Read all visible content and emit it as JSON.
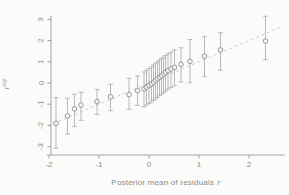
{
  "figure": {
    "xlabel_prefix": "Posterior mean of residuals",
    "xlabel_var": "r",
    "ylabel_var": "r",
    "ylabel_sup": "rep"
  },
  "colors": {
    "background": "#fbfbfa",
    "axis": "#9a9a9a",
    "tick_text": "#8c8c8c",
    "label_text": "#8a8a8a",
    "point_stroke": "#8f8f8f",
    "point_fill": "#f6f6f5",
    "errorbar": "#a8a8a8",
    "dashed_line": "#c6c6c6"
  },
  "chart_data": {
    "type": "scatter",
    "title": "",
    "xlabel": "Posterior mean of residuals r",
    "ylabel": "r^rep",
    "xlim": [
      -2.1,
      2.7
    ],
    "ylim": [
      -3.4,
      3.2
    ],
    "x_ticks": [
      -2,
      -1,
      0,
      1,
      2
    ],
    "y_ticks": [
      -3,
      -2,
      -1,
      0,
      1,
      2,
      3
    ],
    "grid": false,
    "legend": null,
    "reference_line": {
      "style": "dashed",
      "slope": 1,
      "intercept": 0,
      "x_start": -2.02,
      "x_end": 2.7
    },
    "errorbar_style": "vertical-with-caps",
    "points": [
      {
        "x": -1.86,
        "y": -1.9,
        "lo": -3.08,
        "hi": -0.69
      },
      {
        "x": -1.63,
        "y": -1.55,
        "lo": -2.41,
        "hi": -0.72
      },
      {
        "x": -1.49,
        "y": -1.22,
        "lo": -2.06,
        "hi": -0.53
      },
      {
        "x": -1.36,
        "y": -1.04,
        "lo": -1.76,
        "hi": -0.44
      },
      {
        "x": -1.04,
        "y": -0.88,
        "lo": -1.48,
        "hi": -0.3
      },
      {
        "x": -0.77,
        "y": -0.65,
        "lo": -1.31,
        "hi": -0.06
      },
      {
        "x": -0.4,
        "y": -0.55,
        "lo": -1.24,
        "hi": 0.22
      },
      {
        "x": -0.23,
        "y": -0.36,
        "lo": -1.05,
        "hi": 0.33
      },
      {
        "x": -0.1,
        "y": -0.28,
        "lo": -1.12,
        "hi": 0.52
      },
      {
        "x": -0.05,
        "y": -0.2,
        "lo": -1.04,
        "hi": 0.6
      },
      {
        "x": 0.0,
        "y": -0.12,
        "lo": -0.97,
        "hi": 0.68
      },
      {
        "x": 0.05,
        "y": -0.04,
        "lo": -0.9,
        "hi": 0.76
      },
      {
        "x": 0.09,
        "y": 0.04,
        "lo": -0.82,
        "hi": 0.85
      },
      {
        "x": 0.13,
        "y": 0.12,
        "lo": -0.75,
        "hi": 0.93
      },
      {
        "x": 0.17,
        "y": 0.2,
        "lo": -0.68,
        "hi": 1.0
      },
      {
        "x": 0.21,
        "y": 0.27,
        "lo": -0.6,
        "hi": 1.08
      },
      {
        "x": 0.25,
        "y": 0.34,
        "lo": -0.53,
        "hi": 1.15
      },
      {
        "x": 0.29,
        "y": 0.42,
        "lo": -0.46,
        "hi": 1.22
      },
      {
        "x": 0.33,
        "y": 0.5,
        "lo": -0.38,
        "hi": 1.3
      },
      {
        "x": 0.38,
        "y": 0.58,
        "lo": -0.3,
        "hi": 1.38
      },
      {
        "x": 0.44,
        "y": 0.66,
        "lo": -0.22,
        "hi": 1.46
      },
      {
        "x": 0.51,
        "y": 0.74,
        "lo": -0.14,
        "hi": 1.56
      },
      {
        "x": 0.64,
        "y": 0.88,
        "lo": 0.05,
        "hi": 1.66
      },
      {
        "x": 0.82,
        "y": 1.02,
        "lo": 0.01,
        "hi": 2.05
      },
      {
        "x": 1.11,
        "y": 1.27,
        "lo": 0.3,
        "hi": 2.2
      },
      {
        "x": 1.43,
        "y": 1.56,
        "lo": 0.6,
        "hi": 2.37
      },
      {
        "x": 2.33,
        "y": 1.98,
        "lo": 1.1,
        "hi": 3.15
      }
    ]
  }
}
